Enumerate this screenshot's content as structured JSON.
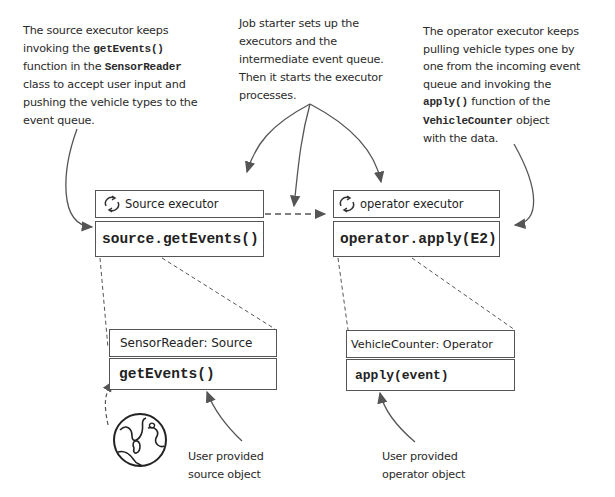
{
  "notes": {
    "source_executor": {
      "line1": "The source executor keeps",
      "line2_pre": "invoking the ",
      "line2_code": "getEvents()",
      "line3_pre": "function in the ",
      "line3_code": "SensorReader",
      "line4": "class to accept user input and",
      "line5": "pushing the vehicle types to the",
      "line6": "event queue."
    },
    "job_starter": {
      "line1": "Job starter sets up the",
      "line2": "executors and the",
      "line3": "intermediate event queue.",
      "line4": "Then it starts the executor",
      "line5": "processes."
    },
    "operator_executor": {
      "line1": "The operator executor keeps",
      "line2": "pulling vehicle types one by",
      "line3": "one from the incoming event",
      "line4": "queue and invoking the",
      "line5_code": "apply()",
      "line5_post": " function of the",
      "line6_code": "VehicleCounter",
      "line6_post": " object",
      "line7": "with the data."
    },
    "user_source": {
      "line1": "User provided",
      "line2": "source object"
    },
    "user_operator": {
      "line1": "User provided",
      "line2": "operator object"
    }
  },
  "boxes": {
    "source_executor": {
      "title": "Source executor",
      "code": "source.getEvents()",
      "icon": "sync-icon"
    },
    "operator_executor": {
      "title": "operator executor",
      "code": "operator.apply(E2)",
      "icon": "sync-icon"
    },
    "sensor_reader": {
      "title": "SensorReader: Source",
      "code": "getEvents()"
    },
    "vehicle_counter": {
      "title": "VehicleCounter: Operator",
      "code": "apply(event)"
    }
  },
  "icons": {
    "globe": "globe-icon"
  },
  "colors": {
    "stroke": "#555555",
    "text": "#222222",
    "background": "#ffffff"
  }
}
